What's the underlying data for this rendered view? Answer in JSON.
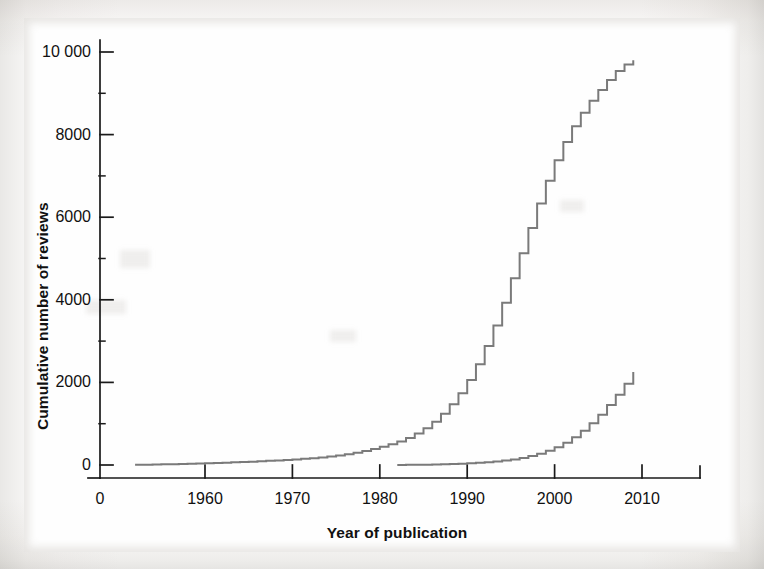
{
  "figure": {
    "background_color": "#fefefe",
    "line_color": "#7a7a7a",
    "axis_color": "#1a1a1a"
  },
  "chart_data": {
    "type": "line",
    "title": "",
    "subtitle": "",
    "xlabel": "Year of publication",
    "ylabel": "Cumulative number of reviews",
    "grid": false,
    "legend": null,
    "legend_position": "none",
    "step": "post",
    "xlim": [
      1950,
      2013
    ],
    "ylim": [
      0,
      10400
    ],
    "axis_break_x": true,
    "x_break_label": "0",
    "xticks": [
      1960,
      1970,
      1980,
      1990,
      2000,
      2010
    ],
    "xticklabels": [
      "1960",
      "1970",
      "1980",
      "1990",
      "2000",
      "2010"
    ],
    "yticks": [
      0,
      2000,
      4000,
      6000,
      8000,
      10000
    ],
    "yticklabels": [
      "0",
      "2000",
      "4000",
      "6000",
      "8000",
      "10 000"
    ],
    "y_minor_ticks": [
      1000,
      3000,
      5000,
      7000,
      9000
    ],
    "series": [
      {
        "name": "All reviews",
        "color": "#7a7a7a",
        "x": [
          1952,
          1953,
          1954,
          1955,
          1956,
          1957,
          1958,
          1959,
          1960,
          1961,
          1962,
          1963,
          1964,
          1965,
          1966,
          1967,
          1968,
          1969,
          1970,
          1971,
          1972,
          1973,
          1974,
          1975,
          1976,
          1977,
          1978,
          1979,
          1980,
          1981,
          1982,
          1983,
          1984,
          1985,
          1986,
          1987,
          1988,
          1989,
          1990,
          1991,
          1992,
          1993,
          1994,
          1995,
          1996,
          1997,
          1998,
          1999,
          2000,
          2001,
          2002,
          2003,
          2004,
          2005,
          2006,
          2007,
          2008,
          2009
        ],
        "values": [
          5,
          8,
          12,
          16,
          20,
          25,
          30,
          36,
          42,
          49,
          56,
          64,
          72,
          81,
          90,
          100,
          111,
          123,
          136,
          150,
          166,
          184,
          205,
          230,
          260,
          296,
          338,
          386,
          440,
          500,
          570,
          655,
          760,
          890,
          1050,
          1240,
          1470,
          1740,
          2060,
          2440,
          2880,
          3380,
          3930,
          4520,
          5130,
          5740,
          6330,
          6880,
          7380,
          7820,
          8200,
          8530,
          8820,
          9080,
          9320,
          9540,
          9700,
          9800
        ]
      },
      {
        "name": "Systematic reviews",
        "color": "#7a7a7a",
        "x": [
          1982,
          1983,
          1984,
          1985,
          1986,
          1987,
          1988,
          1989,
          1990,
          1991,
          1992,
          1993,
          1994,
          1995,
          1996,
          1997,
          1998,
          1999,
          2000,
          2001,
          2002,
          2003,
          2004,
          2005,
          2006,
          2007,
          2008,
          2009
        ],
        "values": [
          2,
          4,
          6,
          9,
          12,
          16,
          22,
          30,
          40,
          52,
          66,
          84,
          106,
          134,
          170,
          216,
          274,
          345,
          432,
          540,
          672,
          828,
          1010,
          1215,
          1450,
          1700,
          1970,
          2250
        ]
      }
    ]
  }
}
